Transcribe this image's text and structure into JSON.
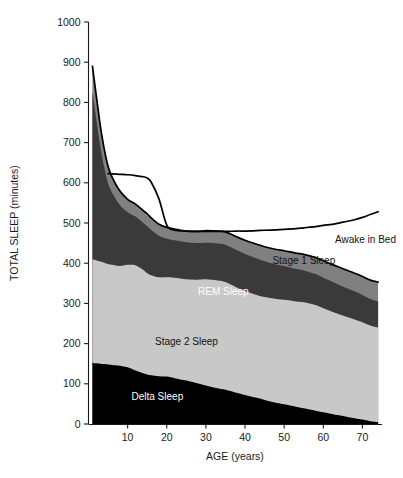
{
  "chart_data": {
    "type": "area",
    "title": "",
    "subtitle": "",
    "xlabel": "AGE (years)",
    "ylabel": "TOTAL SLEEP (minutes)",
    "xlim": [
      0,
      75
    ],
    "ylim": [
      0,
      1000
    ],
    "xticks": [
      10,
      20,
      30,
      40,
      50,
      60,
      70
    ],
    "xtick_labels": [
      "10",
      "20",
      "30",
      "40",
      "50",
      "60",
      "70"
    ],
    "yticks": [
      0,
      100,
      200,
      300,
      400,
      500,
      600,
      700,
      800,
      900,
      1000
    ],
    "ytick_labels": [
      "0",
      "100",
      "200",
      "300",
      "400",
      "500",
      "600",
      "700",
      "800",
      "900",
      "1000"
    ],
    "grid": false,
    "legend_position": "inline-annotations",
    "stacked": true,
    "stack_order_bottom_to_top": [
      "Delta Sleep",
      "Stage 2 Sleep",
      "REM Sleep",
      "Stage 1 Sleep"
    ],
    "x": [
      1,
      2,
      3,
      4,
      5,
      6,
      8,
      10,
      12,
      14,
      15,
      16,
      18,
      20,
      22,
      25,
      28,
      30,
      33,
      35,
      38,
      40,
      43,
      45,
      48,
      50,
      53,
      55,
      58,
      60,
      63,
      65,
      68,
      70,
      72,
      74
    ],
    "series": [
      {
        "name": "Delta Sleep",
        "color": "#000000",
        "values": [
          152,
          151,
          150,
          149,
          148,
          147,
          145,
          141,
          133,
          126,
          123,
          121,
          119,
          118,
          114,
          108,
          101,
          96,
          89,
          85,
          77,
          72,
          65,
          60,
          53,
          49,
          43,
          39,
          33,
          29,
          23,
          20,
          14,
          11,
          7,
          5
        ]
      },
      {
        "name": "Stage 2 Sleep",
        "color": "#c8c8c8",
        "values": [
          258,
          256,
          254,
          252,
          250,
          249,
          248,
          255,
          262,
          257,
          252,
          249,
          246,
          247,
          250,
          252,
          258,
          264,
          268,
          268,
          262,
          259,
          256,
          256,
          258,
          260,
          262,
          264,
          263,
          259,
          254,
          250,
          246,
          242,
          238,
          235
        ]
      },
      {
        "name": "REM Sleep",
        "color": "#3a3a3a",
        "values": [
          418,
          352,
          288,
          238,
          201,
          180,
          152,
          131,
          121,
          117,
          117,
          113,
          103,
          96,
          93,
          92,
          91,
          91,
          92,
          93,
          93,
          92,
          91,
          89,
          86,
          84,
          81,
          79,
          77,
          76,
          74,
          72,
          70,
          68,
          66,
          65
        ]
      },
      {
        "name": "Stage 1 Sleep",
        "color": "#808080",
        "values": [
          62,
          57,
          51,
          46,
          42,
          39,
          35,
          32,
          31,
          31,
          31,
          30,
          29,
          28,
          28,
          28,
          29,
          30,
          31,
          32,
          33,
          34,
          35,
          36,
          37,
          38,
          39,
          40,
          41,
          42,
          43,
          44,
          45,
          46,
          47,
          48
        ]
      }
    ],
    "overlay_line": {
      "name": "Awake in Bed",
      "color": "#000000",
      "description": "Total time in bed; area between this line and top of sleep stack is wakefulness in bed",
      "x": [
        5,
        6,
        8,
        10,
        12,
        14,
        15,
        16,
        18,
        20,
        22,
        25,
        28,
        30,
        33,
        35,
        38,
        40,
        43,
        45,
        48,
        50,
        53,
        55,
        58,
        60,
        63,
        65,
        68,
        70,
        72,
        74
      ],
      "values": [
        623,
        622,
        621,
        620,
        618,
        615,
        612,
        602,
        560,
        495,
        482,
        480,
        479,
        479,
        479,
        479,
        480,
        480,
        481,
        482,
        483,
        484,
        486,
        488,
        491,
        494,
        498,
        502,
        508,
        514,
        521,
        528
      ]
    },
    "annotations": [
      {
        "text": "Awake in Bed",
        "x": 63,
        "y": 450,
        "anchor": "start",
        "color": "#111111"
      },
      {
        "text": "Stage 1 Sleep",
        "x": 47,
        "y": 398,
        "anchor": "start",
        "color": "#111111"
      },
      {
        "text": "REM Sleep",
        "x": 28,
        "y": 322,
        "anchor": "start",
        "color": "#ffffff"
      },
      {
        "text": "Stage 2 Sleep",
        "x": 17,
        "y": 196,
        "anchor": "start",
        "color": "#111111"
      },
      {
        "text": "Delta Sleep",
        "x": 11,
        "y": 60,
        "anchor": "start",
        "color": "#ffffff"
      }
    ]
  },
  "labels": {
    "xaxis_title": "AGE (years)",
    "yaxis_title": "TOTAL SLEEP (minutes)",
    "y_1000": "1000",
    "y_900": "900",
    "y_800": "800",
    "y_700": "700",
    "y_600": "600",
    "y_500": "500",
    "y_400": "400",
    "y_300": "300",
    "y_200": "200",
    "y_100": "100",
    "y_0": "0",
    "x_10": "10",
    "x_20": "20",
    "x_30": "30",
    "x_40": "40",
    "x_50": "50",
    "x_60": "60",
    "x_70": "70",
    "band_awake": "Awake in Bed",
    "band_stage1": "Stage 1 Sleep",
    "band_rem": "REM Sleep",
    "band_stage2": "Stage 2 Sleep",
    "band_delta": "Delta Sleep"
  },
  "colors": {
    "delta": "#000000",
    "stage2": "#c8c8c8",
    "rem": "#3a3a3a",
    "stage1": "#808080",
    "awake_fill": "#ffffff",
    "axis": "#1a1a1a",
    "background": "#ffffff"
  }
}
